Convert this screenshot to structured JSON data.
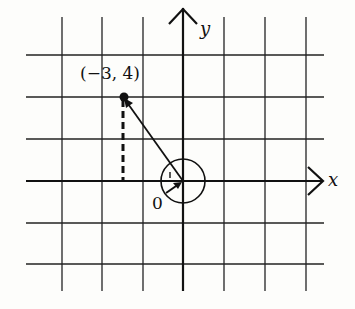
{
  "figure": {
    "type": "coordinate-plane-vector",
    "axes": {
      "x_label": "x",
      "y_label": "y"
    },
    "grid": {
      "vertical_x_px": [
        62,
        102,
        143,
        183,
        224,
        265,
        306
      ],
      "horizontal_y_px": [
        55,
        97,
        139,
        181,
        223,
        264
      ],
      "unit": 1
    },
    "point": {
      "label": "(−3, 4)",
      "x": -3,
      "y": 4
    },
    "origin_label": "0",
    "vector": {
      "from": [
        0,
        0
      ],
      "to": [
        -3,
        4
      ]
    },
    "dashed_projection": {
      "from": [
        -3,
        4
      ],
      "to": [
        -3,
        0
      ]
    },
    "rotation_circle": {
      "center": [
        0,
        0
      ],
      "note": "circular arrow around origin indicating rotation angle"
    }
  }
}
